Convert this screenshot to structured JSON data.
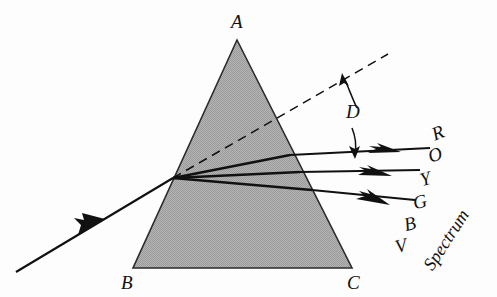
{
  "figure": {
    "background_color": "#fdfdfd",
    "prism_fill_color": "#a8a8a8",
    "line_color": "#111111",
    "width": 497,
    "height": 297
  },
  "prism": {
    "apex_label": "A",
    "bottom_left_label": "B",
    "bottom_right_label": "C",
    "vertices": {
      "A": [
        237,
        40
      ],
      "B": [
        133,
        268
      ],
      "C": [
        352,
        268
      ]
    }
  },
  "rays": {
    "incident": {
      "name": "incident-white-light-ray",
      "start": [
        16,
        272
      ],
      "end": [
        173,
        178
      ]
    },
    "incidence_point": [
      173,
      178
    ],
    "undeviated_dashed": {
      "name": "undeviated-extension-line",
      "start": [
        173,
        178
      ],
      "end": [
        388,
        54
      ],
      "style": "dashed"
    },
    "exit_rays": [
      {
        "label": "R",
        "name": "ray-red",
        "exit_point": [
          290,
          155
        ],
        "tip": [
          430,
          148
        ]
      },
      {
        "label": "Y",
        "name": "ray-yellow",
        "exit_point": [
          300,
          172
        ],
        "tip": [
          420,
          170
        ]
      },
      {
        "label": "G",
        "name": "ray-green",
        "exit_point": [
          312,
          190
        ],
        "tip": [
          415,
          200
        ]
      }
    ],
    "internal_rays": [
      {
        "from": [
          173,
          178
        ],
        "to": [
          290,
          155
        ]
      },
      {
        "from": [
          173,
          178
        ],
        "to": [
          300,
          172
        ]
      },
      {
        "from": [
          173,
          178
        ],
        "to": [
          312,
          190
        ]
      }
    ]
  },
  "deviation": {
    "label": "D",
    "name": "deviation-angle-label",
    "description": "angle of deviation between undeviated direction and emergent ray",
    "label_pos": [
      348,
      110
    ],
    "upper_arrow": {
      "from": [
        356,
        112
      ],
      "to": [
        343,
        75
      ]
    },
    "lower_arrow": {
      "from": [
        354,
        128
      ],
      "to": [
        355,
        158
      ]
    }
  },
  "spectrum": {
    "word": "Spectrum",
    "word_pos": [
      432,
      255
    ],
    "word_rotation_deg": -57,
    "colors": [
      {
        "letter": "R",
        "name": "spectrum-label-red",
        "pos": [
          436,
          131
        ]
      },
      {
        "letter": "O",
        "name": "spectrum-label-orange",
        "pos": [
          432,
          152
        ]
      },
      {
        "letter": "Y",
        "name": "spectrum-label-yellow",
        "pos": [
          424,
          176
        ]
      },
      {
        "letter": "G",
        "name": "spectrum-label-green",
        "pos": [
          418,
          200
        ]
      },
      {
        "letter": "B",
        "name": "spectrum-label-blue",
        "pos": [
          409,
          222
        ]
      },
      {
        "letter": "V",
        "name": "spectrum-label-violet",
        "pos": [
          400,
          244
        ]
      }
    ]
  }
}
